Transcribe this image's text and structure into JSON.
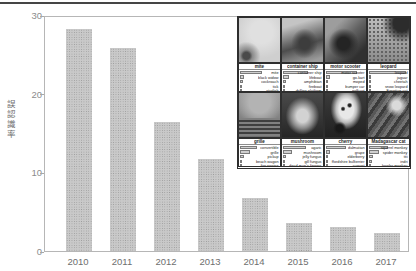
{
  "page": {
    "top_rule_color": "#454545",
    "background": "#ffffff"
  },
  "chart_data": {
    "type": "bar",
    "title": "",
    "categories": [
      "2010",
      "2011",
      "2012",
      "2013",
      "2014",
      "2015",
      "2016",
      "2017"
    ],
    "values": [
      28.2,
      25.8,
      16.4,
      11.7,
      6.7,
      3.6,
      3.0,
      2.3
    ],
    "xlabel": "",
    "ylabel": "誤認識率",
    "yticks": [
      0,
      10,
      20,
      30
    ],
    "ylim": [
      0,
      30
    ],
    "bar_color": "#c9c9c9",
    "grid": false,
    "legend": null,
    "annotation": "inset of image-classification example results overlaid top-right"
  },
  "inset": {
    "panels": [
      {
        "title": "mite",
        "image": "mite-photo",
        "predictions": [
          {
            "label": "mite",
            "p": 0.55
          },
          {
            "label": "black widow",
            "p": 0.1
          },
          {
            "label": "cockroach",
            "p": 0.08
          },
          {
            "label": "tick",
            "p": 0.06
          },
          {
            "label": "starfish",
            "p": 0.03
          }
        ]
      },
      {
        "title": "container ship",
        "image": "container-ship-photo",
        "predictions": [
          {
            "label": "container ship",
            "p": 0.62
          },
          {
            "label": "lifeboat",
            "p": 0.16
          },
          {
            "label": "amphibian",
            "p": 0.09
          },
          {
            "label": "fireboat",
            "p": 0.06
          },
          {
            "label": "drilling platform",
            "p": 0.04
          }
        ]
      },
      {
        "title": "motor scooter",
        "image": "motor-scooter-photo",
        "predictions": [
          {
            "label": "motor scooter",
            "p": 0.78
          },
          {
            "label": "go-kart",
            "p": 0.1
          },
          {
            "label": "moped",
            "p": 0.06
          },
          {
            "label": "bumper car",
            "p": 0.03
          },
          {
            "label": "golfcart",
            "p": 0.02
          }
        ]
      },
      {
        "title": "leopard",
        "image": "leopard-photo",
        "predictions": [
          {
            "label": "leopard",
            "p": 0.92
          },
          {
            "label": "jaguar",
            "p": 0.05
          },
          {
            "label": "cheetah",
            "p": 0.03
          },
          {
            "label": "snow leopard",
            "p": 0.02
          },
          {
            "label": "Egyptian cat",
            "p": 0.01
          }
        ]
      },
      {
        "title": "grille",
        "image": "grille-photo",
        "predictions": [
          {
            "label": "convertible",
            "p": 0.42
          },
          {
            "label": "grille",
            "p": 0.26
          },
          {
            "label": "pickup",
            "p": 0.12
          },
          {
            "label": "beach wagon",
            "p": 0.07
          },
          {
            "label": "fire engine",
            "p": 0.04
          }
        ]
      },
      {
        "title": "mushroom",
        "image": "mushroom-photo",
        "predictions": [
          {
            "label": "agaric",
            "p": 0.58
          },
          {
            "label": "mushroom",
            "p": 0.22
          },
          {
            "label": "jelly fungus",
            "p": 0.08
          },
          {
            "label": "gill fungus",
            "p": 0.05
          },
          {
            "label": "dead-man's-fingers",
            "p": 0.03
          }
        ]
      },
      {
        "title": "cherry",
        "image": "cherry-dalmatian-photo",
        "predictions": [
          {
            "label": "dalmatian",
            "p": 0.5
          },
          {
            "label": "grape",
            "p": 0.1
          },
          {
            "label": "elderberry",
            "p": 0.07
          },
          {
            "label": "ffordshire bullterrier",
            "p": 0.05
          },
          {
            "label": "currant",
            "p": 0.03
          }
        ]
      },
      {
        "title": "Madagascar cat",
        "image": "madagascar-cat-photo",
        "predictions": [
          {
            "label": "squirrel monkey",
            "p": 0.48
          },
          {
            "label": "spider monkey",
            "p": 0.26
          },
          {
            "label": "titi",
            "p": 0.12
          },
          {
            "label": "indri",
            "p": 0.08
          },
          {
            "label": "howler monkey",
            "p": 0.05
          }
        ]
      }
    ]
  }
}
